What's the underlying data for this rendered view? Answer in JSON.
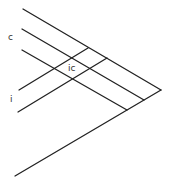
{
  "diagram": {
    "labels": {
      "c": "c",
      "i": "i",
      "ic": "ic"
    },
    "line_color": "#222222",
    "background": "#ffffff",
    "lines": [
      {
        "name": "upper-boundary-line",
        "x1": 23,
        "y1": 9,
        "x2": 161,
        "y2": 90
      },
      {
        "name": "c-line-upper",
        "x1": 22,
        "y1": 29,
        "x2": 144,
        "y2": 100
      },
      {
        "name": "c-line-lower",
        "x1": 22,
        "y1": 50,
        "x2": 127,
        "y2": 110
      },
      {
        "name": "lower-boundary-line",
        "x1": 15,
        "y1": 176,
        "x2": 161,
        "y2": 90
      },
      {
        "name": "i-line-upper",
        "x1": 19,
        "y1": 90,
        "x2": 88,
        "y2": 48
      },
      {
        "name": "i-line-lower",
        "x1": 18,
        "y1": 112,
        "x2": 107,
        "y2": 58
      }
    ]
  }
}
